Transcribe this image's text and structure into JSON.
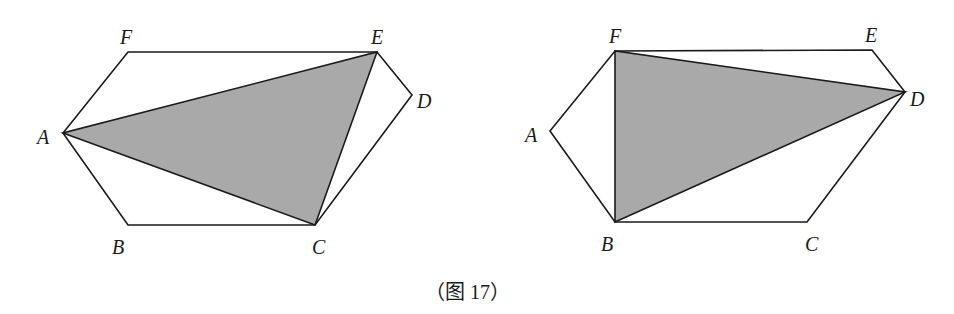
{
  "caption": "（图 17）",
  "colors": {
    "stroke": "#1a1a1a",
    "shade": "#a9a9a9",
    "background": "#ffffff"
  },
  "figures": [
    {
      "name": "left-hexagon",
      "shaded_triangle": [
        "A",
        "C",
        "E"
      ],
      "vertices": {
        "A": {
          "label": "A",
          "x": 63,
          "y": 133
        },
        "B": {
          "label": "B",
          "x": 128,
          "y": 225
        },
        "C": {
          "label": "C",
          "x": 315,
          "y": 225
        },
        "D": {
          "label": "D",
          "x": 412,
          "y": 95
        },
        "E": {
          "label": "E",
          "x": 377,
          "y": 52
        },
        "F": {
          "label": "F",
          "x": 128,
          "y": 52
        }
      }
    },
    {
      "name": "right-hexagon",
      "shaded_triangle": [
        "B",
        "D",
        "F"
      ],
      "vertices": {
        "A": {
          "label": "A",
          "x": 550,
          "y": 131
        },
        "B": {
          "label": "B",
          "x": 615,
          "y": 222
        },
        "C": {
          "label": "C",
          "x": 807,
          "y": 222
        },
        "D": {
          "label": "D",
          "x": 905,
          "y": 92
        },
        "E": {
          "label": "E",
          "x": 872,
          "y": 50
        },
        "F": {
          "label": "F",
          "x": 615,
          "y": 51
        }
      }
    }
  ]
}
